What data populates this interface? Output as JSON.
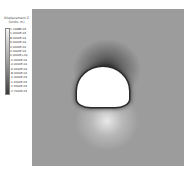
{
  "legend": {
    "title": "Displacement Z",
    "units": "(Units: m)",
    "ticks": [
      "1.1498E-03",
      "1.0000E-03",
      "8.0000E-04",
      "6.0000E-04",
      "4.0000E-04",
      "2.0000E-04",
      "0.0000E+00",
      "-2.0000E-04",
      "-4.0000E-04",
      "-6.0000E-04",
      "-8.0000E-04",
      "-1.0000E-03",
      "-1.2000E-03",
      "-1.5000E-03",
      "-1.7000E-03"
    ],
    "colors": {
      "top": "#f4f4f4",
      "bottom": "#3a3a3a"
    }
  },
  "plot": {
    "description": "Finite element mesh contour of vertical displacement around a horseshoe-shaped tunnel opening",
    "background": "#9c9c9c",
    "crown_zone": "dark",
    "invert_zone": "light"
  }
}
